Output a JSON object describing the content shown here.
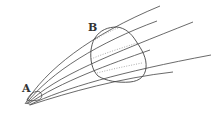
{
  "diagram": {
    "labels": {
      "a": "A",
      "b": "B"
    },
    "colors": {
      "line": "#444444",
      "dotted": "#888888",
      "background": "#ffffff"
    }
  }
}
